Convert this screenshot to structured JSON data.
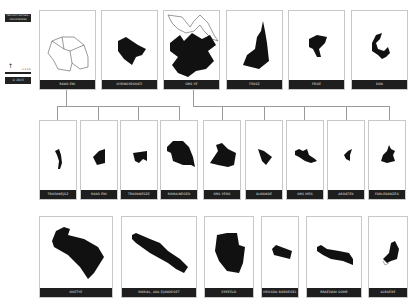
{
  "legend": {
    "title": "TERÜLETI EGYSÉG / VÁROSRÉSZEK",
    "north_symbol": "↑",
    "scale_label": "0 1 km",
    "year": "© 2015"
  },
  "top_row": [
    {
      "label": "RÁKÓ ÉNÍ",
      "fill": "outline"
    },
    {
      "label": "GYÖNGYÖSHÁTI",
      "fill": "solid"
    },
    {
      "label": "ORS YÉ",
      "fill": "mixed"
    },
    {
      "label": "FEKSZ",
      "fill": "solid"
    },
    {
      "label": "FŐGÉ",
      "fill": "solid"
    },
    {
      "label": "DÓK",
      "fill": "solid"
    }
  ],
  "middle_row": [
    {
      "label": "TROPANÉJSZ",
      "parent": 0
    },
    {
      "label": "RÁKÓ ÉNÍ",
      "parent": 0
    },
    {
      "label": "TROPANÉSZE",
      "parent": 0
    },
    {
      "label": "RÓMAINÉGED",
      "parent": 0
    },
    {
      "label": "ÓRS YÉRG",
      "parent": 2
    },
    {
      "label": "ÁLMÁNDÉ",
      "parent": 2
    },
    {
      "label": "ORS MÉG",
      "parent": 2
    },
    {
      "label": "ARDÁTÉK",
      "parent": 2
    },
    {
      "label": "FÁRLEKÁNZÉG",
      "parent": 2
    }
  ],
  "bottom_row": [
    {
      "label": "ÓSETYÉ"
    },
    {
      "label": "MÁRIAL, AKA ÉJÁNDEGET"
    },
    {
      "label": "EPEÉÉLD"
    },
    {
      "label": "HEGGDA BÁRDÉGEL"
    },
    {
      "label": "BRAÉDÁNI SÓMÉ"
    },
    {
      "label": "ALBÁÉRÉ"
    }
  ],
  "colors": {
    "label_bar": "#1e1e1e",
    "shape": "#111111",
    "connector": "#9a9a9a",
    "box_border": "#c8c8c8"
  }
}
